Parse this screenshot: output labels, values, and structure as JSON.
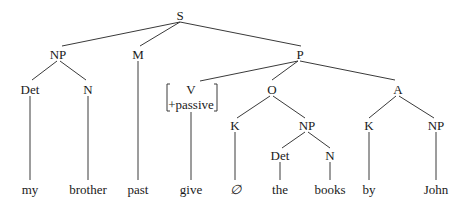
{
  "diagram": {
    "type": "syntax-tree",
    "nodes": {
      "s": "S",
      "np1": "NP",
      "m": "M",
      "p": "P",
      "det1": "Det",
      "n1": "N",
      "v": "V",
      "v_feature": "+passive",
      "o": "O",
      "a": "A",
      "k1": "K",
      "np2": "NP",
      "k2": "K",
      "np3": "NP",
      "det2": "Det",
      "n2": "N"
    },
    "leaves": {
      "my": "my",
      "brother": "brother",
      "past": "past",
      "give": "give",
      "null": "∅",
      "the": "the",
      "books": "books",
      "by": "by",
      "john": "John"
    },
    "structure": "[S [NP [Det my] [N brother]] [M past] [P [V[+passive] give] [O [K ∅] [NP [Det the] [N books]]] [A [K by] [NP John]]]]"
  }
}
